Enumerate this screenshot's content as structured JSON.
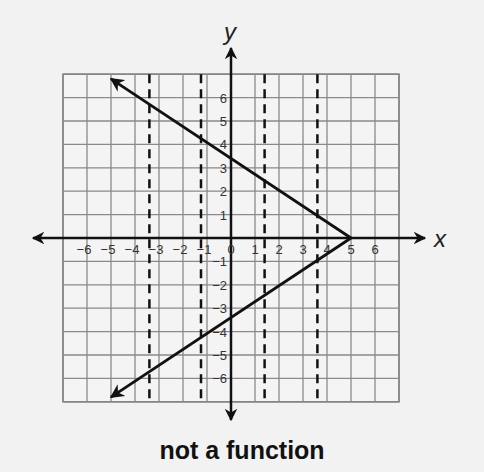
{
  "chart_data": {
    "type": "line",
    "title": "",
    "caption": "not a function",
    "xlabel": "x",
    "ylabel": "y",
    "xlim": [
      -7,
      7
    ],
    "ylim": [
      -7,
      7
    ],
    "grid": true,
    "x_ticks": [
      -6,
      -5,
      -4,
      -3,
      -2,
      -1,
      0,
      1,
      2,
      3,
      4,
      5,
      6
    ],
    "y_ticks": [
      -6,
      -5,
      -4,
      -3,
      -2,
      -1,
      1,
      2,
      3,
      4,
      5,
      6
    ],
    "series": [
      {
        "name": "upper ray",
        "points": [
          [
            5,
            0
          ],
          [
            -5,
            6.8
          ]
        ],
        "arrow_end": true
      },
      {
        "name": "lower ray",
        "points": [
          [
            5,
            0
          ],
          [
            -5,
            -6.8
          ]
        ],
        "arrow_end": true
      }
    ],
    "vertical_dashed_lines": [
      -3.4,
      -1.25,
      1.4,
      3.6
    ],
    "annotations": [
      "vertex at (5, 0)",
      "y-intercepts near 3.4 and -3.4"
    ]
  },
  "labels": {
    "x_axis": "x",
    "y_axis": "y",
    "caption": "not a function"
  }
}
